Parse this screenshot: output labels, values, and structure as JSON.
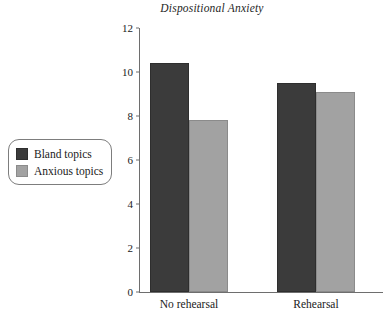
{
  "chart_data": {
    "type": "bar",
    "title": "Dispositional Anxiety",
    "xlabel": "",
    "ylabel": "",
    "ylim": [
      0,
      12
    ],
    "yticks": [
      0,
      2,
      4,
      6,
      8,
      10,
      12
    ],
    "ytick_labels": [
      "0",
      "2",
      "4",
      "6",
      "8",
      "10",
      "12"
    ],
    "grid": false,
    "legend_position": "left-outside",
    "categories": [
      "No rehearsal",
      "Rehearsal"
    ],
    "series": [
      {
        "name": "Bland topics",
        "color": "#3b3b3b",
        "values": [
          10.4,
          9.5
        ]
      },
      {
        "name": "Anxious topics",
        "color": "#a2a2a2",
        "values": [
          7.8,
          9.1
        ]
      }
    ]
  },
  "legend": {
    "items": [
      {
        "label": "Bland topics"
      },
      {
        "label": "Anxious topics"
      }
    ]
  }
}
